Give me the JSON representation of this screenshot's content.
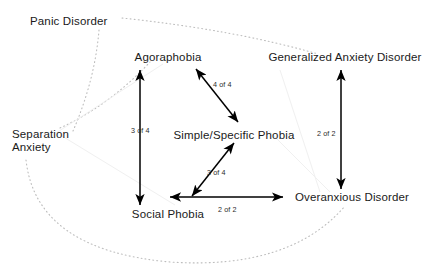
{
  "diagram": {
    "type": "node-link-graph",
    "background_color": "#ffffff",
    "solid_edge_color": "#000000",
    "dotted_edge_color": "#b9b9b9",
    "nodes": [
      {
        "id": "panic",
        "label": "Panic Disorder",
        "x": 30,
        "y": 22
      },
      {
        "id": "agoraphobia",
        "label": "Agoraphobia",
        "x": 168,
        "y": 58
      },
      {
        "id": "gad",
        "label": "Generalized Anxiety Disorder",
        "x": 345,
        "y": 58
      },
      {
        "id": "separation",
        "label": "Separation",
        "x": 12,
        "y": 135
      },
      {
        "id": "separation2",
        "label": "Anxiety",
        "x": 12,
        "y": 148
      },
      {
        "id": "simple",
        "label": "Simple/Specific Phobia",
        "x": 234,
        "y": 136
      },
      {
        "id": "social",
        "label": "Social Phobia",
        "x": 168,
        "y": 215
      },
      {
        "id": "overanxious",
        "label": "Overanxious Disorder",
        "x": 352,
        "y": 198
      }
    ],
    "edges": [
      {
        "id": "agoraphobia-social",
        "from": "agoraphobia",
        "to": "social",
        "style": "solid",
        "arrows": "both",
        "label": "3 of 4",
        "label_x": 131,
        "label_y": 126
      },
      {
        "id": "agoraphobia-simple",
        "from": "agoraphobia",
        "to": "simple",
        "style": "solid",
        "arrows": "both",
        "label": "4 of 4",
        "label_x": 213,
        "label_y": 80
      },
      {
        "id": "simple-social",
        "from": "simple",
        "to": "social",
        "style": "solid",
        "arrows": "both",
        "label": "3 of 4",
        "label_x": 207,
        "label_y": 168
      },
      {
        "id": "social-overanxious",
        "from": "social",
        "to": "overanxious",
        "style": "solid",
        "arrows": "both",
        "label": "2 of 2",
        "label_x": 218,
        "label_y": 205
      },
      {
        "id": "gad-overanxious",
        "from": "gad",
        "to": "overanxious",
        "style": "solid",
        "arrows": "both",
        "label": "2 of 2",
        "label_x": 317,
        "label_y": 129
      },
      {
        "id": "panic-separation",
        "from": "panic",
        "to": "separation",
        "style": "dotted",
        "arrows": "none",
        "label": "",
        "label_x": 0,
        "label_y": 0
      },
      {
        "id": "panic-gad",
        "from": "panic",
        "to": "gad",
        "style": "dotted",
        "arrows": "none",
        "label": "",
        "label_x": 0,
        "label_y": 0
      },
      {
        "id": "separation-agoraphobia",
        "from": "separation",
        "to": "agoraphobia",
        "style": "dotted",
        "arrows": "none",
        "label": "",
        "label_x": 0,
        "label_y": 0
      },
      {
        "id": "separation-overanxious",
        "from": "separation",
        "to": "overanxious",
        "style": "dotted",
        "arrows": "none",
        "label": "",
        "label_x": 0,
        "label_y": 0
      }
    ]
  }
}
